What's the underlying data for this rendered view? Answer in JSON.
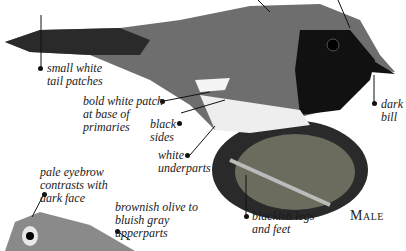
{
  "labels": {
    "tail": "small white\ntail patches",
    "patch": "bold white patch\nat base of\nprimaries",
    "sides": "black\nsides",
    "underparts": "white\nunderparts",
    "bill": "dark\nbill",
    "legs": "blackish legs\nand feet",
    "eyebrow": "pale eyebrow\ncontrasts with\ndark face",
    "upperparts": "brownish olive to\nbluish gray\nupperparts"
  },
  "sex_label": "Male",
  "colors": {
    "ink": "#1a1a1a",
    "bird_dark": "#2a2a2a",
    "bird_mid": "#6e6e6e",
    "bird_light": "#cfcfcf"
  }
}
